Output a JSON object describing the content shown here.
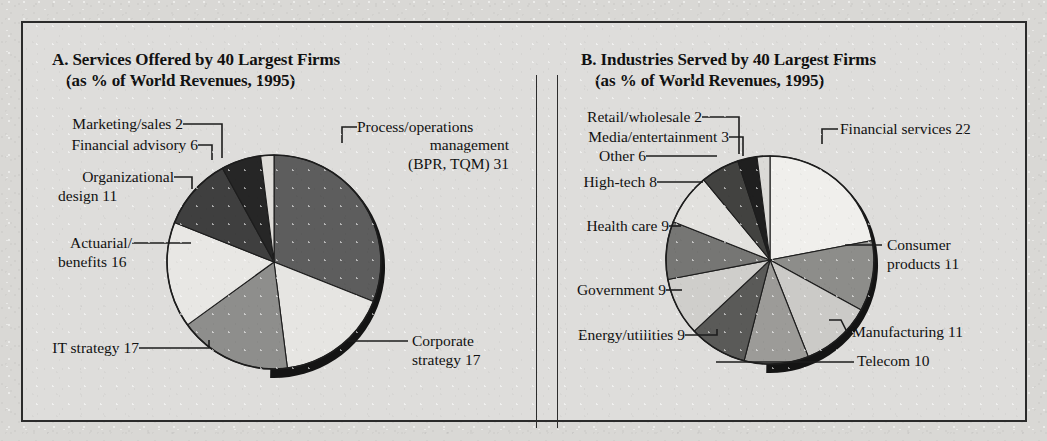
{
  "figure": {
    "background_color": "#dedddb",
    "frame_color": "#2b2b2b"
  },
  "panels": [
    {
      "id": "A",
      "title_line1": "A. Services Offered by 40 Largest Firms",
      "title_line2": "(as % of World Revenues, 1995)"
    },
    {
      "id": "B",
      "title_line1": "B. Industries Served by 40 Largest Firms",
      "title_line2": "(as % of World Revenues, 1995)"
    }
  ],
  "labels_a": {
    "marketing": "Marketing/sales 2",
    "financial_advisory": "Financial advisory 6",
    "organizational_1": "Organizational",
    "organizational_2": "design 11",
    "actuarial_1": "Actuarial/",
    "actuarial_2": "benefits 16",
    "it_strategy": "IT strategy 17",
    "process_1": "Process/operations",
    "process_2": "management",
    "process_3": "(BPR, TQM) 31",
    "corporate_1": "Corporate",
    "corporate_2": "strategy 17"
  },
  "labels_b": {
    "retail": "Retail/wholesale 2",
    "media": "Media/entertainment 3",
    "other": "Other 6",
    "hightech": "High-tech 8",
    "healthcare": "Health care 9",
    "government": "Government 9",
    "energy": "Energy/utilities 9",
    "financial": "Financial services 22",
    "consumer_1": "Consumer",
    "consumer_2": "products 11",
    "manufacturing": "Manufacturing 11",
    "telecom": "Telecom 10"
  },
  "chart_data": [
    {
      "type": "pie",
      "id": "A",
      "title": "A. Services Offered by 40 Largest Firms (as % of World Revenues, 1995)",
      "unit": "% of World Revenues",
      "year": 1995,
      "start_angle_deg": 0,
      "direction": "clockwise",
      "total": 100,
      "categories": [
        "Process/operations management (BPR, TQM)",
        "Corporate strategy",
        "IT strategy",
        "Actuarial/benefits",
        "Organizational design",
        "Financial advisory",
        "Marketing/sales"
      ],
      "values": [
        31,
        17,
        17,
        16,
        11,
        6,
        2
      ],
      "slice_colors": [
        "#5d5d5d",
        "#e6e5e2",
        "#8e8e8c",
        "#e8e7e4",
        "#3f3f3f",
        "#262626",
        "#dedcd8"
      ]
    },
    {
      "type": "pie",
      "id": "B",
      "title": "B. Industries Served by 40 Largest Firms (as % of World Revenues, 1995)",
      "unit": "% of World Revenues",
      "year": 1995,
      "start_angle_deg": 0,
      "direction": "clockwise",
      "total": 100,
      "categories": [
        "Financial services",
        "Consumer products",
        "Manufacturing",
        "Telecom",
        "Energy/utilities",
        "Government",
        "Health care",
        "High-tech",
        "Other",
        "Media/entertainment",
        "Retail/wholesale"
      ],
      "values": [
        22,
        11,
        11,
        10,
        9,
        9,
        9,
        8,
        6,
        3,
        2
      ],
      "slice_colors": [
        "#f0efec",
        "#8d8d8a",
        "#cbcac7",
        "#9c9b98",
        "#5a5a58",
        "#cfcecb",
        "#767674",
        "#e2e1de",
        "#424240",
        "#1f1f1f",
        "#dbdad7"
      ]
    }
  ]
}
